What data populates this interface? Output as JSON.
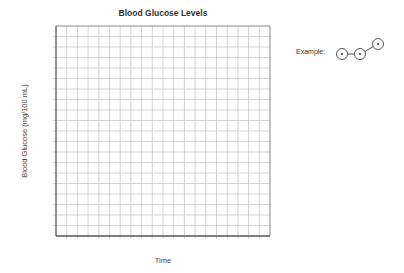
{
  "chart_data": {
    "type": "line",
    "title": "Blood Glucose Levels",
    "xlabel": "Time",
    "ylabel": "Blood Glucose (mg/100 mL)",
    "grid": true,
    "grid_columns": 20,
    "grid_rows": 20,
    "series": [],
    "x": [],
    "annotations": [
      {
        "label": "Example:",
        "description": "three circled points connected by line segments"
      }
    ]
  },
  "example": {
    "label": "Example:",
    "points": [
      [
        12,
        20
      ],
      [
        30,
        20
      ],
      [
        48,
        10
      ]
    ]
  },
  "colors": {
    "grid_line": "#c8c8c8",
    "axis": "#555555",
    "border": "#8a8a8a"
  }
}
